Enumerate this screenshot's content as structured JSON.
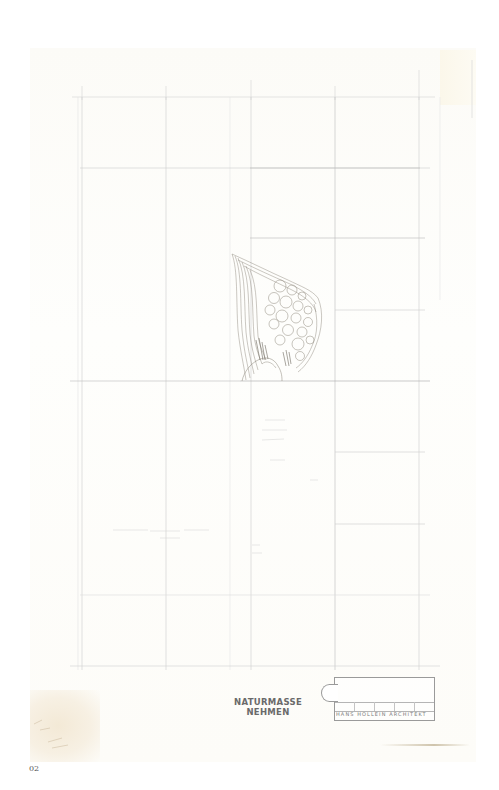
{
  "caption": {
    "figure_number": "02"
  },
  "drawing": {
    "label_line_1": "NATURMASSE",
    "label_line_2": "NEHMEN",
    "title_block": {
      "firm": "HANS HOLLEIN ARCHITEKT",
      "cells": [
        "",
        "",
        "",
        "",
        "",
        ""
      ]
    }
  },
  "colors": {
    "paper": "#fdfcf8",
    "grid_line": "#c9c9c9",
    "pencil": "#8a8478",
    "label_text": "#6a6a6a",
    "caption_text": "#555555"
  }
}
